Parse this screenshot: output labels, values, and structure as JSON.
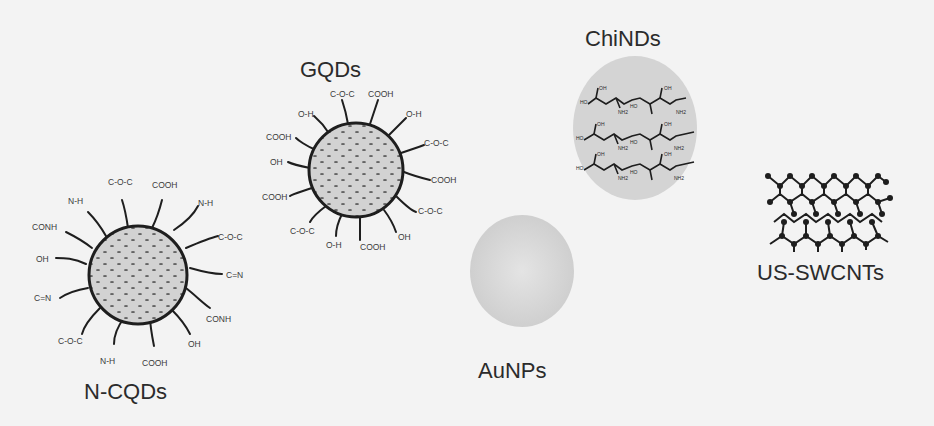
{
  "figure": {
    "type": "schematic of nanomaterials",
    "nanomaterials": [
      {
        "id": "gqds",
        "label": "GQDs",
        "shape": "spherical carbon cage with functional groups",
        "functional_groups": [
          "C-O-C",
          "COOH",
          "O-H",
          "C-O-C",
          "COOH",
          "C-O-C",
          "OH",
          "COOH",
          "O-H",
          "C-O-C",
          "COOH",
          "OH",
          "COOH",
          "O-H"
        ]
      },
      {
        "id": "n-cqds",
        "label": "N-CQDs",
        "shape": "spherical carbon cage with functional groups",
        "functional_groups": [
          "C-O-C",
          "COOH",
          "N-H",
          "C-O-C",
          "C=N",
          "CONH",
          "OH",
          "COOH",
          "N-H",
          "C-O-C",
          "C=N",
          "OH",
          "CONH",
          "N-H"
        ]
      },
      {
        "id": "chinds",
        "label": "ChiNDs",
        "shape": "gray ellipse with chitosan chains",
        "chain_labels": [
          "OH",
          "HO",
          "NH2",
          "O"
        ]
      },
      {
        "id": "aunps",
        "label": "AuNPs",
        "shape": "light gray sphere"
      },
      {
        "id": "us-swcnts",
        "label": "US-SWCNTs",
        "shape": "hexagonal carbon lattice sheet"
      }
    ],
    "colors": {
      "background": "#f3f3f3",
      "line": "#1e1e1e",
      "sphere_fill": "#cfcfcf",
      "ellipse_fill": "#d6d6d6",
      "text": "#2b2b2b"
    }
  }
}
